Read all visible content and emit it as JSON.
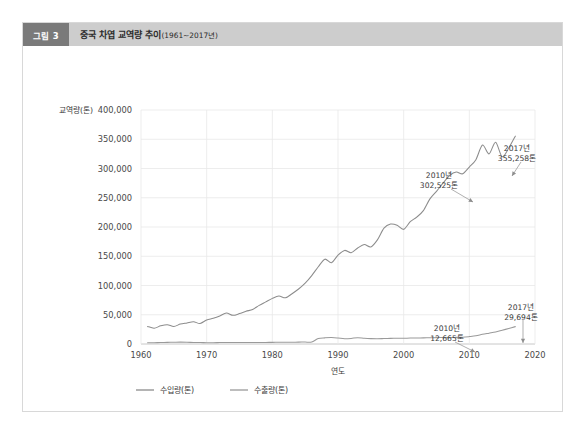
{
  "figure": {
    "badge": "그림 3",
    "title_main": "중국 차엽 교역량 추이",
    "title_range": "(1961~2017년)"
  },
  "chart_data": {
    "type": "line",
    "title": "중국 차엽 교역량 추이(1961~2017년)",
    "xlabel": "연도",
    "ylabel": "교역량(톤)",
    "xlim": [
      1960,
      2020
    ],
    "ylim": [
      0,
      400000
    ],
    "xticks": [
      "1960",
      "1970",
      "1980",
      "1990",
      "2000",
      "2010",
      "2020"
    ],
    "yticks": [
      "0",
      "50,000",
      "100,000",
      "150,000",
      "200,000",
      "250,000",
      "300,000",
      "350,000",
      "400,000"
    ],
    "grid": true,
    "legend_position": "bottom",
    "x": [
      1961,
      1962,
      1963,
      1964,
      1965,
      1966,
      1967,
      1968,
      1969,
      1970,
      1971,
      1972,
      1973,
      1974,
      1975,
      1976,
      1977,
      1978,
      1979,
      1980,
      1981,
      1982,
      1983,
      1984,
      1985,
      1986,
      1987,
      1988,
      1989,
      1990,
      1991,
      1992,
      1993,
      1994,
      1995,
      1996,
      1997,
      1998,
      1999,
      2000,
      2001,
      2002,
      2003,
      2004,
      2005,
      2006,
      2007,
      2008,
      2009,
      2010,
      2011,
      2012,
      2013,
      2014,
      2015,
      2016,
      2017
    ],
    "series": [
      {
        "name": "수입량(톤)",
        "color": "#8c8c8c",
        "values": [
          30000,
          27000,
          31000,
          33000,
          30000,
          34000,
          36000,
          38000,
          35000,
          41000,
          44000,
          48000,
          53000,
          49000,
          52000,
          56000,
          59000,
          66000,
          72000,
          78000,
          82000,
          79000,
          86000,
          94000,
          104000,
          117000,
          132000,
          145000,
          139000,
          152000,
          160000,
          156000,
          164000,
          170000,
          166000,
          178000,
          198000,
          205000,
          203000,
          196000,
          209000,
          217000,
          228000,
          248000,
          261000,
          275000,
          288000,
          294000,
          291000,
          302525,
          315000,
          340000,
          325000,
          345000,
          320000,
          335000,
          355258
        ]
      },
      {
        "name": "수출량(톤)",
        "color": "#9a9a9a",
        "values": [
          2000,
          2200,
          2500,
          2800,
          3000,
          3200,
          3000,
          2600,
          2400,
          2300,
          2200,
          2400,
          2500,
          2600,
          2700,
          2600,
          2500,
          2600,
          2700,
          2800,
          2900,
          3000,
          3100,
          3200,
          3300,
          3400,
          9500,
          10500,
          11000,
          10200,
          9000,
          9500,
          10800,
          9800,
          9200,
          9000,
          9300,
          9600,
          9800,
          9900,
          10100,
          10300,
          10500,
          10700,
          10900,
          11000,
          11200,
          11300,
          11600,
          12665,
          14000,
          16500,
          18500,
          20500,
          23500,
          26500,
          29694
        ]
      }
    ],
    "annotations": [
      {
        "id": "import-2010",
        "year_label": "2010년",
        "value_label": "302,525톤",
        "year": 2010,
        "value": 302525
      },
      {
        "id": "import-2017",
        "year_label": "2017년",
        "value_label": "355,258톤",
        "year": 2017,
        "value": 355258
      },
      {
        "id": "export-2010",
        "year_label": "2010년",
        "value_label": "12,665톤",
        "year": 2010,
        "value": 12665
      },
      {
        "id": "export-2017",
        "year_label": "2017년",
        "value_label": "29,694톤",
        "year": 2017,
        "value": 29694
      }
    ]
  }
}
